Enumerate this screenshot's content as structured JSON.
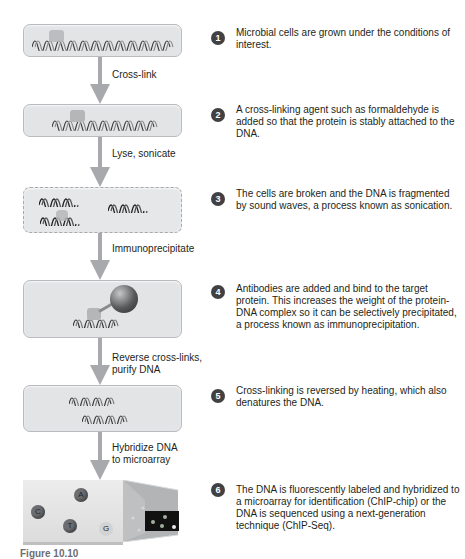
{
  "figure": {
    "caption": "Figure 10.10"
  },
  "arrows": [
    {
      "label_lines": [
        "Cross-link"
      ]
    },
    {
      "label_lines": [
        "Lyse, sonicate"
      ]
    },
    {
      "label_lines": [
        "Immunoprecipitate"
      ]
    },
    {
      "label_lines": [
        "Reverse cross-links,",
        "purify DNA"
      ]
    },
    {
      "label_lines": [
        "Hybridize DNA",
        "to microarray"
      ]
    }
  ],
  "steps": [
    {
      "number": "1",
      "text": "Microbial cells are grown under the conditions of interest."
    },
    {
      "number": "2",
      "text": "A cross-linking agent such as formaldehyde is added so that the protein is stably attached to the DNA."
    },
    {
      "number": "3",
      "text": "The cells are broken and the DNA is fragmented by sound waves, a process known as sonication."
    },
    {
      "number": "4",
      "text": "Antibodies are added and bind to the target protein. This increases the weight of the protein-DNA complex so it can be selectively precipitated, a process known as immunoprecipitation."
    },
    {
      "number": "5",
      "text": "Cross-linking is reversed by heating, which also denatures the DNA."
    },
    {
      "number": "6",
      "text": "The DNA is fluorescently labeled and hybridized to a microarray for identification (ChIP-chip) or the DNA is sequenced using a next-generation technique (ChIP-Seq)."
    }
  ],
  "microarray": {
    "spots": [
      {
        "label": "A"
      },
      {
        "label": "C"
      },
      {
        "label": "T"
      },
      {
        "label": "G"
      }
    ]
  },
  "colors": {
    "box_fill": "#e3e4e6",
    "box_border": "#b9bbbe",
    "arrow": "#a7a9ac",
    "step_badge": "#414042",
    "protein": "#b5b6b8",
    "antibody": "#58595b"
  }
}
